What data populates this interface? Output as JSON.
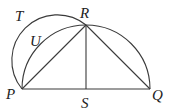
{
  "diagram": {
    "type": "geometry",
    "points": {
      "P": {
        "label": "P",
        "x": 24,
        "y": 89
      },
      "Q": {
        "label": "Q",
        "x": 151,
        "y": 89
      },
      "R": {
        "label": "R",
        "x": 86,
        "y": 24
      },
      "S": {
        "label": "S",
        "x": 86,
        "y": 89
      }
    },
    "arc_labels": {
      "T": {
        "label": "T"
      },
      "U": {
        "label": "U"
      }
    },
    "segments": [
      "PQ",
      "SR",
      "PR",
      "RQ"
    ],
    "arcs": [
      "large semicircle PRQ (centre S)",
      "semicircle PTR on PR"
    ],
    "stroke_color": "#3a3a3a"
  }
}
